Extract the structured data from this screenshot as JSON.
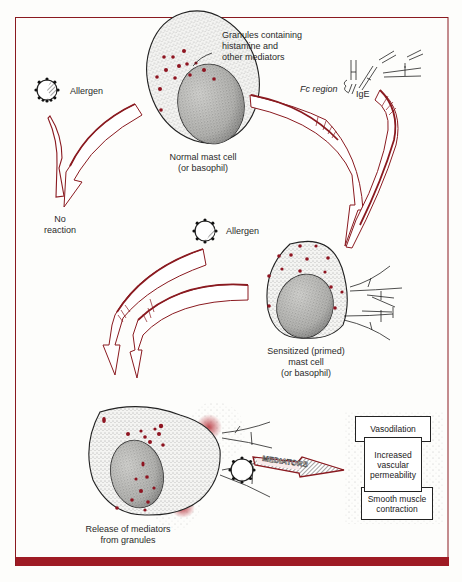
{
  "figure": {
    "frame_color": "#8a1a20",
    "accent_red": "#9e1b24",
    "granule_color": "#8e1420"
  },
  "labels": {
    "granules": [
      "Granules containing",
      "histamine and",
      "other mediators"
    ],
    "allergen_top": "Allergen",
    "allergen_middle": "Allergen",
    "normal_cell": [
      "Normal mast cell",
      "(or basophil)"
    ],
    "fc_region": "Fc region",
    "ige": "IgE",
    "no_reaction": [
      "No",
      "reaction"
    ],
    "sensitized_cell": [
      "Sensitized (primed)",
      "mast cell",
      "(or basophil)"
    ],
    "release": [
      "Release of mediators",
      "from granules"
    ],
    "mediators_arrow": "MEDIATORS"
  },
  "effects": {
    "boxes": [
      {
        "label": "Vasodilation"
      },
      {
        "label": "Increased vascular permeability"
      },
      {
        "label": "Smooth muscle contraction"
      }
    ]
  }
}
